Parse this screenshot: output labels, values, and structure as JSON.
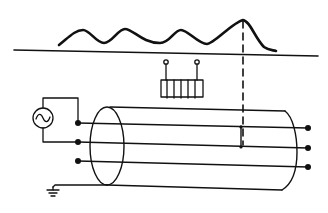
{
  "diagram": {
    "title": "",
    "colors": {
      "stroke": "#111111",
      "background": "#ffffff"
    },
    "elements": {
      "surface_line": {
        "label": ""
      },
      "wave": {
        "label": "",
        "peaks": 4
      },
      "dashed_marker": {
        "label": ""
      },
      "coil": {
        "label": "",
        "turns": 5
      },
      "ac_source": {
        "label": "",
        "symbol": "~"
      },
      "cable_shield": {
        "label": ""
      },
      "conductors": [
        {
          "label": ""
        },
        {
          "label": ""
        },
        {
          "label": ""
        }
      ],
      "ground": {
        "label": ""
      }
    }
  }
}
